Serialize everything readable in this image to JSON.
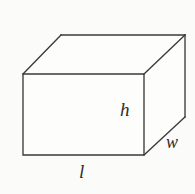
{
  "figure": {
    "background_color": "#fbfbfa",
    "line_color": "#3a3a3a",
    "face_color": "#fdfdfc",
    "text_color": "#2e2e2e"
  },
  "labels": {
    "height": "h",
    "width": "w",
    "length": "l"
  },
  "geometry": {
    "front_face": {
      "top_left": [
        23,
        74
      ],
      "top_right": [
        144,
        74
      ],
      "bottom_right": [
        144,
        155
      ],
      "bottom_left": [
        23,
        155
      ]
    },
    "back_face": {
      "top_left": [
        61,
        35
      ],
      "top_right": [
        185,
        35
      ],
      "bottom_right": [
        185,
        117
      ]
    },
    "top_face_path": "23,74 61,35 185,35 144,74",
    "right_face_path": "144,74 185,35 185,117 144,155",
    "front_face_path": "23,74 144,74 144,155 23,155"
  }
}
